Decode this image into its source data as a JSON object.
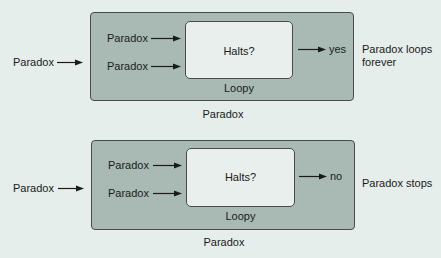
{
  "diagrams": [
    {
      "input_label": "Paradox",
      "inner_input_1": "Paradox",
      "inner_input_2": "Paradox",
      "decider_label": "Halts?",
      "machine_label": "Loopy",
      "output_label": "yes",
      "result_line1": "Paradox loops",
      "result_line2": "forever",
      "caption": "Paradox"
    },
    {
      "input_label": "Paradox",
      "inner_input_1": "Paradox",
      "inner_input_2": "Paradox",
      "decider_label": "Halts?",
      "machine_label": "Loopy",
      "output_label": "no",
      "result_line1": "Paradox stops",
      "result_line2": "",
      "caption": "Paradox"
    }
  ],
  "colors": {
    "background": "#e6eeec",
    "outer_box": "#a9bab5",
    "inner_box": "#e9efed",
    "stroke": "#4a4a4a"
  }
}
